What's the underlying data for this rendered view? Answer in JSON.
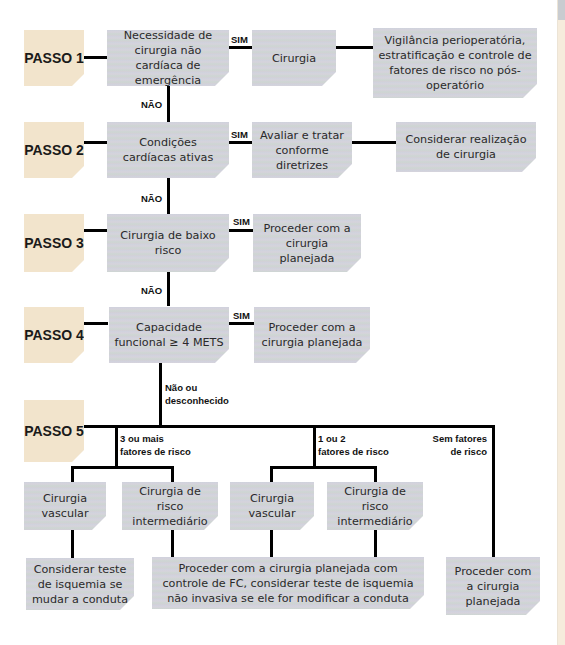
{
  "steps": {
    "p1": "PASSO 1",
    "p2": "PASSO 2",
    "p3": "PASSO 3",
    "p4": "PASSO 4",
    "p5": "PASSO 5"
  },
  "row1": {
    "question": "Necessidade de cirurgia não cardíaca de emergência",
    "yes_label": "SIM",
    "yes_action": "Cirurgia",
    "outcome": "Vigilância perioperatória, estratificação e controle de fatores de risco no pós-operatório",
    "no_label": "NÃO"
  },
  "row2": {
    "question": "Condições cardíacas ativas",
    "yes_label": "SIM",
    "yes_action": "Avaliar e tratar conforme diretrizes",
    "outcome": "Considerar realização de cirurgia",
    "no_label": "NÃO"
  },
  "row3": {
    "question": "Cirurgia de baixo risco",
    "yes_label": "SIM",
    "yes_action": "Proceder com a cirurgia planejada",
    "no_label": "NÃO"
  },
  "row4": {
    "question": "Capacidade funcional ≥ 4 METS",
    "yes_label": "SIM",
    "yes_action": "Proceder com a cirurgia planejada",
    "no_label_1": "Não ou",
    "no_label_2": "desconhecido"
  },
  "row5": {
    "branch_a_1": "3 ou mais",
    "branch_a_2": "fatores de risco",
    "branch_b_1": "1 ou 2",
    "branch_b_2": "fatores de risco",
    "branch_c_1": "Sem fatores",
    "branch_c_2": "de risco",
    "a_vascular": "Cirurgia vascular",
    "a_intermediate": "Cirurgia de risco intermediário",
    "b_vascular": "Cirurgia vascular",
    "b_intermediate": "Cirurgia de risco intermediário",
    "a_outcome": "Considerar teste de isquemia se mudar a conduta",
    "b_outcome": "Proceder com a cirurgia planejada com controle de FC, considerar teste de isquemia não invasiva se ele for modificar a conduta",
    "c_outcome": "Proceder com a cirurgia planejada"
  },
  "colors": {
    "step_box": "#f2e4cc",
    "node_box": "#d1d3da",
    "connector": "#000000"
  }
}
